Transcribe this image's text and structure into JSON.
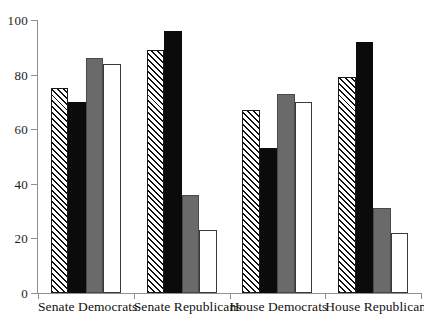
{
  "chart_data": {
    "type": "bar",
    "title": "",
    "subtitle": "",
    "xlabel": "",
    "ylabel": "",
    "ylim": [
      0,
      100
    ],
    "yticks": [
      0,
      20,
      40,
      60,
      80,
      100
    ],
    "ytick_labels": [
      "0",
      "20",
      "40",
      "60",
      "80",
      "100"
    ],
    "grid": false,
    "legend": "none",
    "categories": [
      "Senate Democrats",
      "Senate Republicans",
      "House Democrats",
      "House Republicans"
    ],
    "series": [
      {
        "name": "series-1",
        "fill": "diagonal-hatch",
        "values": [
          75,
          89,
          67,
          79
        ]
      },
      {
        "name": "series-2",
        "fill": "solid-black",
        "values": [
          70,
          96,
          53,
          92
        ]
      },
      {
        "name": "series-3",
        "fill": "solid-gray",
        "values": [
          86,
          36,
          73,
          31
        ]
      },
      {
        "name": "series-4",
        "fill": "white-outline",
        "values": [
          84,
          23,
          70,
          22
        ]
      }
    ]
  },
  "colors": {
    "hatch_line": "#111111",
    "hatch_background": "#ffffff",
    "black_bar": "#0b0b0b",
    "gray_bar": "#6a6a6a",
    "white_bar": "#ffffff",
    "bar_outline": "#1a1a1a",
    "axis": "#8e8e8e",
    "text": "#111111"
  },
  "cropped_header_text": "   "
}
